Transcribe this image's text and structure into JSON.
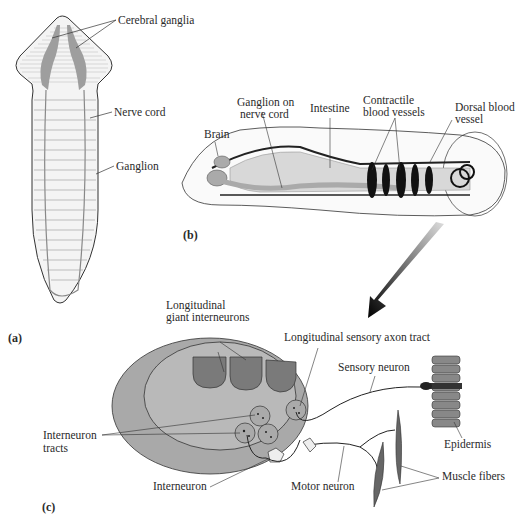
{
  "figure": {
    "panels": {
      "a": "(a)",
      "b": "(b)",
      "c": "(c)"
    },
    "panel_a_labels": {
      "cerebral_ganglia": "Cerebral ganglia",
      "nerve_cord": "Nerve cord",
      "ganglion": "Ganglion"
    },
    "panel_b_labels": {
      "brain": "Brain",
      "ganglion_on_nerve_cord_1": "Ganglion on",
      "ganglion_on_nerve_cord_2": "nerve cord",
      "intestine": "Intestine",
      "contractile_1": "Contractile",
      "contractile_2": "blood vessels",
      "dorsal_1": "Dorsal blood",
      "dorsal_2": "vessel"
    },
    "panel_c_labels": {
      "giant_1": "Longitudinal",
      "giant_2": "giant interneurons",
      "sensory_tract": "Longitudinal sensory axon tract",
      "sensory_neuron": "Sensory neuron",
      "interneuron_tracts_1": "Interneuron",
      "interneuron_tracts_2": "tracts",
      "interneuron": "Interneuron",
      "motor_neuron": "Motor neuron",
      "epidermis": "Epidermis",
      "muscle_fibers": "Muscle fibers"
    },
    "colors": {
      "cord_fill": "#a9a9a9",
      "inner_fill": "#bdbdbd",
      "giant_fill": "#7a7a7a",
      "ganglia_fill": "#9e9e9e",
      "line": "#333333"
    }
  }
}
